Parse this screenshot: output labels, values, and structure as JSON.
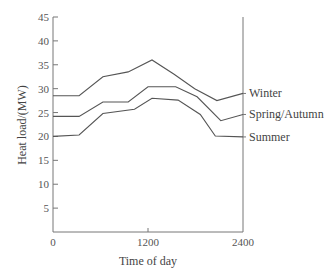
{
  "chart_data": {
    "type": "line",
    "title": "",
    "xlabel": "Time of day",
    "ylabel": "Heat load/(MW)",
    "xlim": [
      0,
      2400
    ],
    "ylim": [
      0,
      45
    ],
    "x_ticks": [
      0,
      1200,
      2400
    ],
    "x_tick_labels": [
      "0",
      "1200",
      "2400"
    ],
    "y_ticks": [
      5,
      10,
      15,
      20,
      25,
      30,
      35,
      40,
      45
    ],
    "y_tick_labels": [
      "5",
      "10",
      "15",
      "20",
      "25",
      "30",
      "35",
      "40",
      "45"
    ],
    "grid": false,
    "legend_position": "right, inline labels at line ends",
    "series": [
      {
        "name": "Winter",
        "points": [
          [
            0,
            28.5
          ],
          [
            330,
            28.5
          ],
          [
            630,
            32.5
          ],
          [
            950,
            33.5
          ],
          [
            1250,
            36
          ],
          [
            1530,
            33
          ],
          [
            1790,
            30
          ],
          [
            2070,
            27.5
          ],
          [
            2400,
            29
          ]
        ]
      },
      {
        "name": "Spring/Autumn",
        "points": [
          [
            0,
            24.2
          ],
          [
            330,
            24.2
          ],
          [
            630,
            27.2
          ],
          [
            950,
            27.2
          ],
          [
            1200,
            30.4
          ],
          [
            1550,
            30.4
          ],
          [
            1820,
            28.3
          ],
          [
            2120,
            23.3
          ],
          [
            2400,
            24.6
          ]
        ]
      },
      {
        "name": "Summer",
        "points": [
          [
            0,
            20
          ],
          [
            330,
            20.3
          ],
          [
            630,
            24.8
          ],
          [
            1030,
            25.7
          ],
          [
            1250,
            28
          ],
          [
            1580,
            27.6
          ],
          [
            1860,
            24.6
          ],
          [
            2050,
            20.1
          ],
          [
            2400,
            19.9
          ]
        ]
      }
    ]
  },
  "colors": {
    "line": "#555555",
    "axis": "#777777",
    "text": "#444444"
  }
}
